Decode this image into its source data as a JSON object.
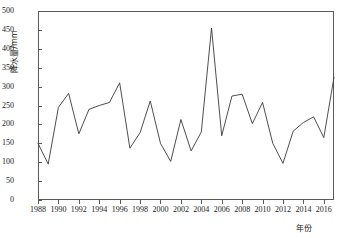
{
  "chart_data": {
    "type": "line",
    "title": "",
    "xlabel": "年份",
    "ylabel": "降水量/mm",
    "xlim": [
      1988,
      2017
    ],
    "ylim": [
      0,
      500
    ],
    "ytick_step": 50,
    "xtick_step": 2,
    "grid": false,
    "legend": null,
    "line_color": "#3a3a3a",
    "axis_color": "#5a5a5a",
    "yticks": [
      "0",
      "50",
      "100",
      "150",
      "200",
      "250",
      "300",
      "350",
      "400",
      "450",
      "500"
    ],
    "xticks": [
      "1988",
      "1990",
      "1992",
      "1994",
      "1996",
      "1998",
      "2000",
      "2002",
      "2004",
      "2006",
      "2008",
      "2010",
      "2012",
      "2014",
      "2016"
    ],
    "x": [
      1988,
      1989,
      1990,
      1991,
      1992,
      1993,
      1994,
      1995,
      1996,
      1997,
      1998,
      1999,
      2000,
      2001,
      2002,
      2003,
      2004,
      2005,
      2006,
      2007,
      2008,
      2009,
      2010,
      2011,
      2012,
      2013,
      2014,
      2015,
      2016,
      2017
    ],
    "values": [
      150,
      95,
      245,
      282,
      175,
      240,
      250,
      258,
      310,
      137,
      178,
      262,
      150,
      102,
      213,
      130,
      180,
      455,
      170,
      275,
      280,
      202,
      258,
      150,
      97,
      182,
      205,
      220,
      165,
      325
    ],
    "series_name": "降水量"
  }
}
